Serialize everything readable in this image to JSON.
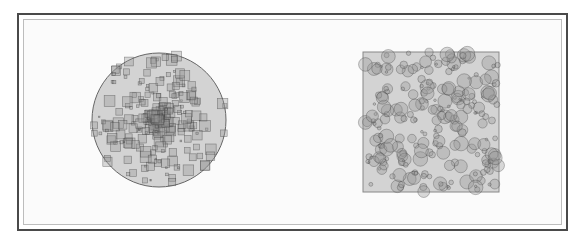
{
  "figure": {
    "left_panel": {
      "container_shape": "circle",
      "marker_shape": "square",
      "distribution": "center-concentrated",
      "container": {
        "cx": 159,
        "cy": 120,
        "r": 67
      },
      "fill_color": "#d3d3d3",
      "stroke_color": "#666666"
    },
    "right_panel": {
      "container_shape": "square",
      "marker_shape": "circle",
      "distribution": "uniform",
      "container": {
        "x": 363,
        "y": 52,
        "w": 136,
        "h": 140
      },
      "fill_color": "#d3d3d3",
      "stroke_color": "#888888"
    },
    "colors": {
      "frame": "#4a4a4a",
      "inner_border": "#bdbdbd",
      "background": "#fbfbfb",
      "marker_fill": "rgba(150,150,150,0.35)",
      "marker_stroke": "rgba(60,60,60,0.55)"
    }
  }
}
